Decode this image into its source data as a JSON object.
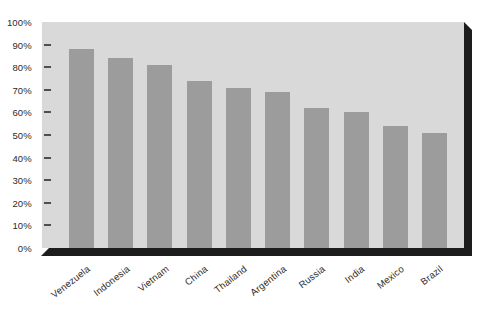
{
  "chart_data": {
    "type": "bar",
    "categories": [
      "Venezuela",
      "Indonesia",
      "Vietnam",
      "China",
      "Thailand",
      "Argentina",
      "Russia",
      "India",
      "Mexico",
      "Brazil"
    ],
    "values": [
      88,
      84,
      81,
      74,
      71,
      69,
      62,
      60,
      54,
      51
    ],
    "value_unit": "%",
    "y_axis": {
      "ticks": [
        "100%",
        "90%",
        "80%",
        "70%",
        "60%",
        "50%",
        "40%",
        "30%",
        "20%",
        "10%",
        "0%"
      ],
      "min": 0,
      "max": 100,
      "step": 10
    },
    "grid": false,
    "legend": null,
    "layout": {
      "orientation": "vertical",
      "x_label_rotation_deg": -38,
      "shadow_3d": true
    },
    "colors": {
      "bar": "#9c9c9c",
      "plot_background": "#d9d9d9",
      "page_background": "#ffffff",
      "shadow": "#1d1d1d",
      "text": "#2b2b2b",
      "tick": "#4f4f4f"
    }
  }
}
